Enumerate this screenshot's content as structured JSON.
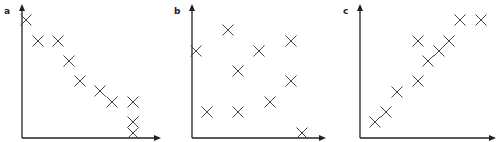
{
  "chart_data": [
    {
      "type": "scatter",
      "panel_label": "a",
      "title": "",
      "xlabel": "",
      "ylabel": "",
      "marker": "x",
      "grid": false,
      "description": "negative correlation",
      "x_px": [
        26,
        38,
        58,
        69,
        80,
        100,
        112,
        133,
        133,
        133
      ],
      "y_px": [
        20,
        41,
        41,
        61,
        81,
        91,
        102,
        102,
        122,
        133
      ],
      "x": [
        0.4,
        1.6,
        3.6,
        4.7,
        5.8,
        7.8,
        9.0,
        11.1,
        11.1,
        11.1
      ],
      "y": [
        11.8,
        9.7,
        9.7,
        7.7,
        5.7,
        4.7,
        3.6,
        3.6,
        1.6,
        0.5
      ]
    },
    {
      "type": "scatter",
      "panel_label": "b",
      "title": "",
      "xlabel": "",
      "ylabel": "",
      "marker": "x",
      "grid": false,
      "description": "no correlation",
      "x_px": [
        196,
        228,
        238,
        259,
        291,
        291,
        270,
        207,
        238,
        302
      ],
      "y_px": [
        51,
        30,
        71,
        51,
        41,
        81,
        102,
        112,
        112,
        133
      ],
      "x": [
        0.4,
        3.6,
        4.6,
        6.7,
        9.9,
        9.9,
        7.8,
        1.5,
        4.6,
        11.0
      ],
      "y": [
        8.7,
        10.8,
        6.7,
        8.7,
        9.7,
        5.7,
        3.6,
        2.6,
        2.6,
        0.5
      ]
    },
    {
      "type": "scatter",
      "panel_label": "c",
      "title": "",
      "xlabel": "",
      "ylabel": "",
      "marker": "x",
      "grid": false,
      "description": "positive correlation",
      "x_px": [
        375,
        386,
        397,
        418,
        418,
        428,
        439,
        449,
        460,
        481
      ],
      "y_px": [
        122,
        112,
        92,
        81,
        41,
        61,
        51,
        41,
        20,
        20
      ],
      "x": [
        1.5,
        2.6,
        3.7,
        5.8,
        5.8,
        6.8,
        7.9,
        8.9,
        10.0,
        12.1
      ],
      "y": [
        1.6,
        2.6,
        4.6,
        5.7,
        9.7,
        7.7,
        8.7,
        9.7,
        11.8,
        11.8
      ]
    }
  ],
  "panels": [
    {
      "label": "a",
      "axis_origin": [
        22,
        138
      ],
      "y_top": 5,
      "x_right": 160
    },
    {
      "label": "b",
      "axis_origin": [
        192,
        138
      ],
      "y_top": 5,
      "x_right": 325
    },
    {
      "label": "c",
      "axis_origin": [
        360,
        138
      ],
      "y_top": 5,
      "x_right": 495
    }
  ],
  "colors": {
    "axis": "#222222",
    "marker": "#444444",
    "background": "#ffffff"
  }
}
